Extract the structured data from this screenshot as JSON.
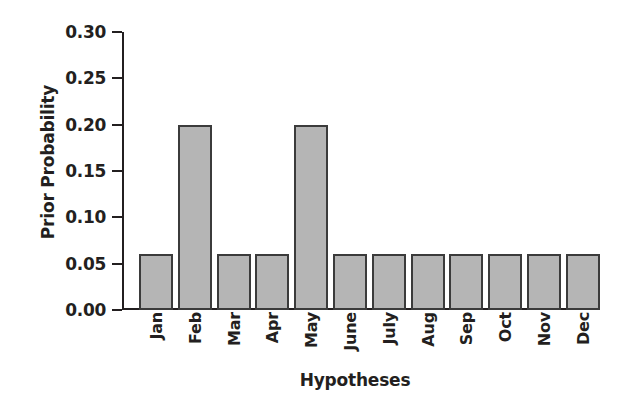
{
  "chart_data": {
    "type": "bar",
    "title": "",
    "xlabel": "Hypotheses",
    "ylabel": "Prior Probability",
    "categories": [
      "Jan",
      "Feb",
      "Mar",
      "Apr",
      "May",
      "June",
      "July",
      "Aug",
      "Sep",
      "Oct",
      "Nov",
      "Dec"
    ],
    "values": [
      0.06,
      0.2,
      0.06,
      0.06,
      0.2,
      0.06,
      0.06,
      0.06,
      0.06,
      0.06,
      0.06,
      0.06
    ],
    "ylim": [
      0.0,
      0.3
    ],
    "ytick_labels": [
      "0.30",
      "0.25",
      "0.20",
      "0.15",
      "0.10",
      "0.05",
      "0.00"
    ],
    "ytick_values": [
      0.3,
      0.25,
      0.2,
      0.15,
      0.1,
      0.05,
      0.0
    ],
    "grid": false,
    "legend": null,
    "bar_fill_color": "#b5b5b5",
    "bar_edge_color": "#3b3b3b",
    "axis_color": "#231f20",
    "background_color": "#ffffff"
  }
}
